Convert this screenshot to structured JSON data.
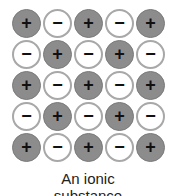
{
  "figure": {
    "rows": [
      [
        "+",
        "-",
        "+",
        "-",
        "+"
      ],
      [
        "-",
        "+",
        "-",
        "+",
        "-"
      ],
      [
        "+",
        "-",
        "+",
        "-",
        "+"
      ],
      [
        "-",
        "+",
        "-",
        "+",
        "-"
      ],
      [
        "+",
        "-",
        "+",
        "-",
        "+"
      ]
    ],
    "symbols": {
      "+": "+",
      "-": "−"
    },
    "colors": {
      "cation_fill": "#8c8c8c",
      "anion_fill": "#ffffff",
      "anion_border": "#a8a8a8"
    },
    "caption_line1": "An ionic",
    "caption_line2": "substance"
  }
}
